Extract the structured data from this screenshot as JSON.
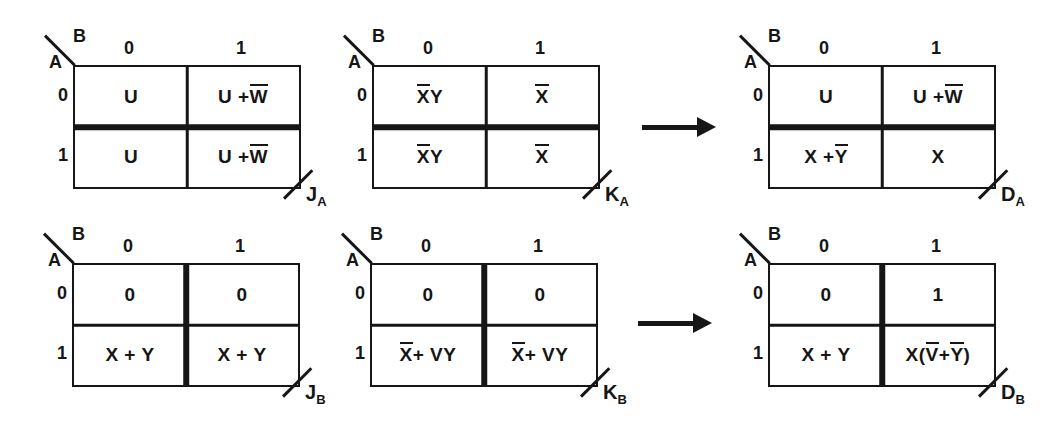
{
  "figure": {
    "background": "#ffffff",
    "ink": "#161616",
    "description_labels": {
      "row_var": "A",
      "col_var": "B"
    }
  },
  "maps": [
    {
      "row_var": "A",
      "col_var": "B",
      "col_headers": [
        "0",
        "1"
      ],
      "row_headers": [
        "0",
        "1"
      ],
      "cells": [
        [
          "U",
          "U + {W}"
        ],
        [
          "U",
          "U + {W}"
        ]
      ],
      "thick_divider": "horizontal",
      "output": {
        "letter": "J",
        "sub": "A"
      }
    },
    {
      "row_var": "A",
      "col_var": "B",
      "col_headers": [
        "0",
        "1"
      ],
      "row_headers": [
        "0",
        "1"
      ],
      "cells": [
        [
          "{X}Y",
          "{X}"
        ],
        [
          "{X}Y",
          "{X}"
        ]
      ],
      "thick_divider": "horizontal",
      "output": {
        "letter": "K",
        "sub": "A"
      }
    },
    {
      "row_var": "A",
      "col_var": "B",
      "col_headers": [
        "0",
        "1"
      ],
      "row_headers": [
        "0",
        "1"
      ],
      "cells": [
        [
          "U",
          "U + {W}"
        ],
        [
          "X + {Y}",
          "X"
        ]
      ],
      "thick_divider": "horizontal",
      "output": {
        "letter": "D",
        "sub": "A"
      }
    },
    {
      "row_var": "A",
      "col_var": "B",
      "col_headers": [
        "0",
        "1"
      ],
      "row_headers": [
        "0",
        "1"
      ],
      "cells": [
        [
          "0",
          "0"
        ],
        [
          "X + Y",
          "X + Y"
        ]
      ],
      "thick_divider": "vertical",
      "output": {
        "letter": "J",
        "sub": "B"
      }
    },
    {
      "row_var": "A",
      "col_var": "B",
      "col_headers": [
        "0",
        "1"
      ],
      "row_headers": [
        "0",
        "1"
      ],
      "cells": [
        [
          "0",
          "0"
        ],
        [
          "{X} + VY",
          "{X} + VY"
        ]
      ],
      "thick_divider": "vertical",
      "output": {
        "letter": "K",
        "sub": "B"
      }
    },
    {
      "row_var": "A",
      "col_var": "B",
      "col_headers": [
        "0",
        "1"
      ],
      "row_headers": [
        "0",
        "1"
      ],
      "cells": [
        [
          "0",
          "1"
        ],
        [
          "X + Y",
          "X({V} + {Y})"
        ]
      ],
      "thick_divider": "vertical",
      "output": {
        "letter": "D",
        "sub": "B"
      }
    }
  ],
  "arrows": [
    {
      "direction": "right",
      "between": "KA-and-DA"
    },
    {
      "direction": "right",
      "between": "KB-and-DB"
    }
  ]
}
